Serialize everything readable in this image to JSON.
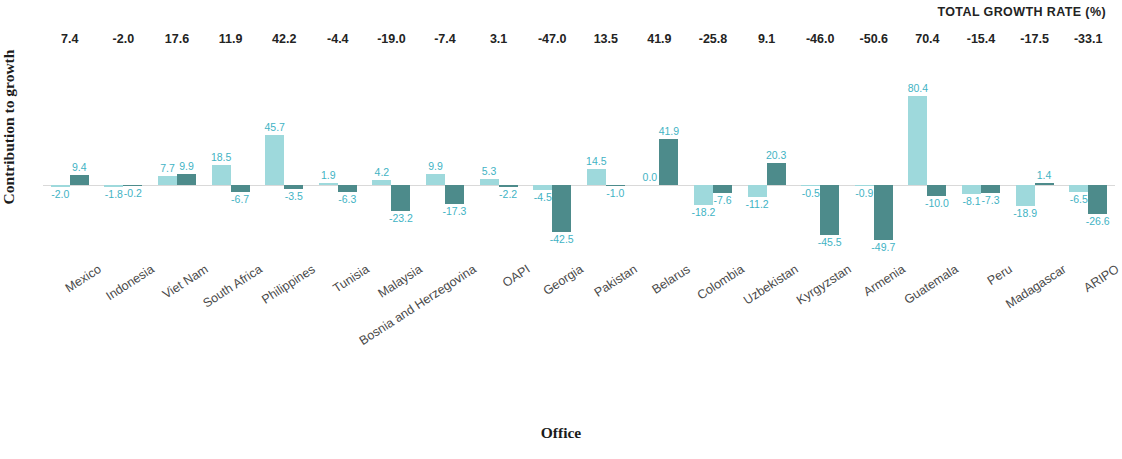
{
  "header": {
    "total_growth_title": "TOTAL GROWTH RATE (%)"
  },
  "axes": {
    "y_title": "Contribution to growth",
    "x_title": "Office"
  },
  "colors": {
    "series_light": "#9ed9dc",
    "series_dark": "#4d8b8b",
    "value_label": "#3fb3c4",
    "total_label": "#232323",
    "baseline": "#d9d9d9"
  },
  "chart_data": {
    "type": "bar",
    "title": "TOTAL GROWTH RATE (%)",
    "xlabel": "Office",
    "ylabel": "Contribution to growth",
    "grid": false,
    "legend_position": "none",
    "ylim": [
      -52,
      84
    ],
    "baseline": 0,
    "categories": [
      "Mexico",
      "Indonesia",
      "Viet Nam",
      "South Africa",
      "Philippines",
      "Tunisia",
      "Malaysia",
      "Bosnia and Herzegovina",
      "OAPI",
      "Georgia",
      "Pakistan",
      "Belarus",
      "Colombia",
      "Uzbekistan",
      "Kyrgyzstan",
      "Armenia",
      "Guatemala",
      "Peru",
      "Madagascar",
      "ARIPO"
    ],
    "series": [
      {
        "name": "series-light",
        "values": [
          -2.0,
          -1.8,
          7.7,
          18.5,
          45.7,
          1.9,
          4.2,
          9.9,
          5.3,
          -4.5,
          14.5,
          0.0,
          -18.2,
          -11.2,
          -0.5,
          -0.9,
          80.4,
          -8.1,
          -18.9,
          -6.5
        ]
      },
      {
        "name": "series-dark",
        "values": [
          9.4,
          -0.2,
          9.9,
          -6.7,
          -3.5,
          -6.3,
          -23.2,
          -17.3,
          -2.2,
          -42.5,
          -1.0,
          41.9,
          -7.6,
          20.3,
          -45.5,
          -49.7,
          -10.0,
          -7.3,
          1.4,
          -26.6
        ]
      }
    ],
    "total_growth_rate": [
      7.4,
      -2.0,
      17.6,
      11.9,
      42.2,
      -4.4,
      -19.0,
      -7.4,
      3.1,
      -47.0,
      13.5,
      41.9,
      -25.8,
      9.1,
      -46.0,
      -50.6,
      70.4,
      -15.4,
      -17.5,
      -33.1
    ]
  }
}
